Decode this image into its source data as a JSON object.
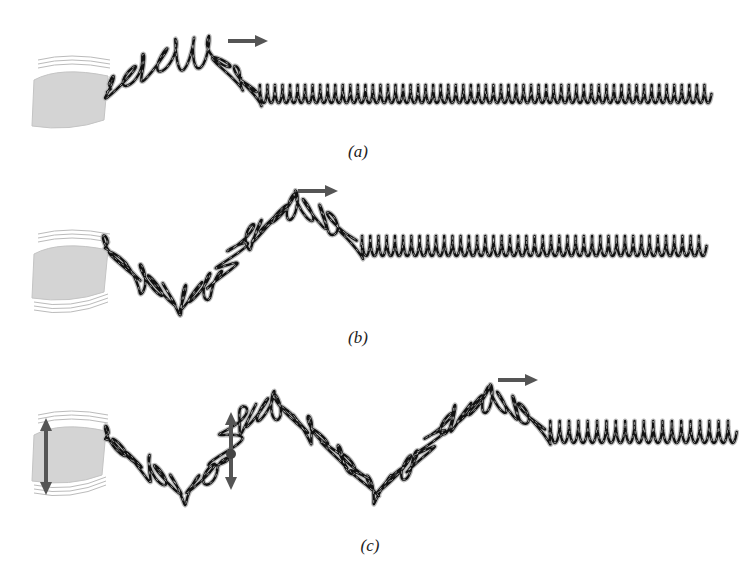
{
  "panels": [
    {
      "id": "a",
      "label": "(a)",
      "label_pos": [
        358,
        154
      ],
      "hand": {
        "x": 30,
        "y": 70,
        "w": 78,
        "h": 58,
        "shake_arrow": false
      },
      "arrow": {
        "x1": 228,
        "x2": 268,
        "y": 41
      },
      "centerline": [
        [
          104,
          92
        ],
        [
          140,
          70
        ],
        [
          175,
          55
        ],
        [
          210,
          52
        ],
        [
          238,
          78
        ],
        [
          258,
          94
        ],
        [
          710,
          94
        ]
      ],
      "coils": [
        [
          104,
          238,
          8,
          16
        ],
        [
          238,
          258,
          2,
          14
        ],
        [
          258,
          710,
          60,
          9
        ]
      ]
    },
    {
      "id": "b",
      "label": "(b)",
      "label_pos": [
        358,
        340
      ],
      "hand": {
        "x": 30,
        "y": 244,
        "w": 78,
        "h": 56,
        "shake_arrow": false
      },
      "arrow": {
        "x1": 298,
        "x2": 338,
        "y": 191
      },
      "centerline": [
        [
          106,
          250
        ],
        [
          140,
          278
        ],
        [
          180,
          300
        ],
        [
          210,
          285
        ],
        [
          250,
          235
        ],
        [
          295,
          205
        ],
        [
          330,
          220
        ],
        [
          360,
          246
        ],
        [
          705,
          246
        ]
      ],
      "coils": [
        [
          106,
          180,
          6,
          16
        ],
        [
          180,
          295,
          11,
          15
        ],
        [
          295,
          360,
          5,
          15
        ],
        [
          360,
          705,
          42,
          10
        ]
      ]
    },
    {
      "id": "c",
      "label": "(c)",
      "label_pos": [
        370,
        548
      ],
      "hand": {
        "x": 30,
        "y": 425,
        "w": 76,
        "h": 58,
        "shake_arrow": true,
        "shake_x": 46,
        "shake_y1": 418,
        "shake_y2": 495
      },
      "mid_arrow": {
        "x": 231,
        "y1": 412,
        "y2": 490,
        "dot_y": 454
      },
      "arrow": {
        "x1": 498,
        "x2": 538,
        "y": 380
      },
      "centerline": [
        [
          106,
          440
        ],
        [
          150,
          470
        ],
        [
          185,
          490
        ],
        [
          215,
          470
        ],
        [
          240,
          420
        ],
        [
          275,
          405
        ],
        [
          310,
          430
        ],
        [
          345,
          460
        ],
        [
          375,
          490
        ],
        [
          410,
          465
        ],
        [
          450,
          420
        ],
        [
          490,
          398
        ],
        [
          520,
          410
        ],
        [
          548,
          432
        ],
        [
          735,
          432
        ]
      ],
      "coils": [
        [
          106,
          215,
          8,
          15
        ],
        [
          215,
          310,
          9,
          15
        ],
        [
          310,
          410,
          10,
          15
        ],
        [
          410,
          490,
          8,
          15
        ],
        [
          490,
          548,
          5,
          14
        ],
        [
          548,
          735,
          20,
          11
        ]
      ]
    }
  ],
  "colors": {
    "coil_dark": "#111111",
    "coil_light": "#bdbdbd",
    "arrow": "#555555",
    "hand": "#d4d4d4"
  }
}
